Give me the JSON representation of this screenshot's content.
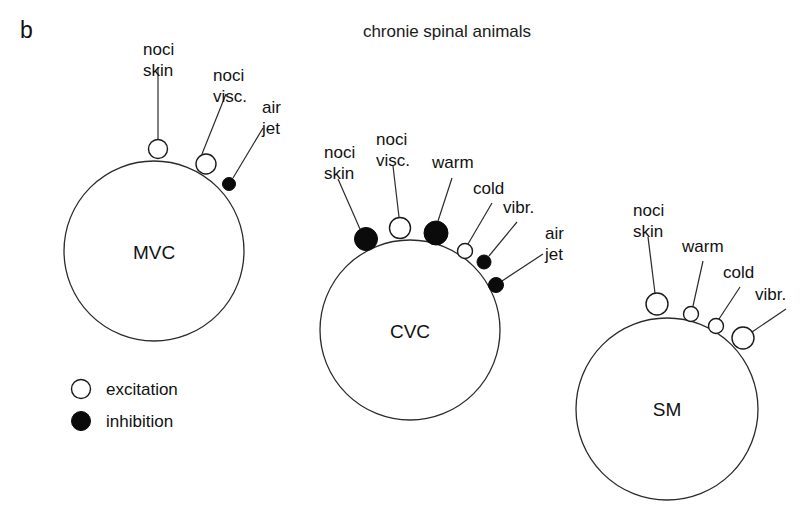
{
  "figure": {
    "panel_label": "b",
    "title": "chronie spinal animals",
    "colors": {
      "stroke": "#2b2b2b",
      "excitation_fill": "#ffffff",
      "inhibition_fill": "#0b0b0b",
      "background": "#ffffff"
    }
  },
  "legend": {
    "items": [
      {
        "symbol": "open-circle",
        "label": "excitation"
      },
      {
        "symbol": "filled-circle",
        "label": "inhibition"
      }
    ]
  },
  "groups": [
    {
      "id": "mvc",
      "name": "MVC",
      "circle": {
        "cx": 154,
        "cy": 251,
        "r": 90
      },
      "name_pos": {
        "x": 154,
        "y": 259
      },
      "markers": [
        {
          "id": "mvc-noci-skin",
          "label": "noci skin",
          "label_lines": [
            "noci",
            "skin"
          ],
          "type": "excitation",
          "marker": {
            "cx": 158,
            "cy": 149,
            "r": 9.5
          },
          "label_pos": {
            "x": 143,
            "y": 55
          },
          "connector": {
            "x1": 158,
            "y1": 139,
            "x2": 158,
            "y2": 67
          }
        },
        {
          "id": "mvc-noci-visc",
          "label": "noci visc.",
          "label_lines": [
            "noci",
            "visc."
          ],
          "type": "excitation",
          "marker": {
            "cx": 206,
            "cy": 164,
            "r": 10
          },
          "label_pos": {
            "x": 213,
            "y": 81
          },
          "connector": {
            "x1": 202,
            "y1": 154,
            "x2": 226,
            "y2": 94
          }
        },
        {
          "id": "mvc-air-jet",
          "label": "air jet",
          "label_lines": [
            "air",
            "jet"
          ],
          "type": "inhibition",
          "marker": {
            "cx": 229,
            "cy": 184,
            "r": 6.5
          },
          "label_pos": {
            "x": 262,
            "y": 113
          },
          "connector": {
            "x1": 233,
            "y1": 178,
            "x2": 263,
            "y2": 128
          }
        }
      ]
    },
    {
      "id": "cvc",
      "name": "CVC",
      "circle": {
        "cx": 410,
        "cy": 330,
        "r": 90
      },
      "name_pos": {
        "x": 410,
        "y": 338
      },
      "markers": [
        {
          "id": "cvc-noci-skin",
          "label": "noci skin",
          "label_lines": [
            "noci",
            "skin"
          ],
          "type": "inhibition",
          "marker": {
            "cx": 366,
            "cy": 239,
            "r": 11.5
          },
          "label_pos": {
            "x": 324,
            "y": 158
          },
          "connector": {
            "x1": 360,
            "y1": 229,
            "x2": 338,
            "y2": 179
          }
        },
        {
          "id": "cvc-noci-visc",
          "label": "noci visc.",
          "label_lines": [
            "noci",
            "visc."
          ],
          "type": "excitation",
          "marker": {
            "cx": 400,
            "cy": 228,
            "r": 10.5
          },
          "label_pos": {
            "x": 376,
            "y": 145
          },
          "connector": {
            "x1": 399,
            "y1": 217,
            "x2": 393,
            "y2": 166
          }
        },
        {
          "id": "cvc-warm",
          "label": "warm",
          "label_lines": [
            "warm"
          ],
          "type": "inhibition",
          "marker": {
            "cx": 436,
            "cy": 233,
            "r": 12
          },
          "label_pos": {
            "x": 432,
            "y": 168
          },
          "connector": {
            "x1": 438,
            "y1": 221,
            "x2": 452,
            "y2": 178
          }
        },
        {
          "id": "cvc-cold",
          "label": "cold",
          "label_lines": [
            "cold"
          ],
          "type": "excitation",
          "marker": {
            "cx": 465,
            "cy": 251,
            "r": 7.5
          },
          "label_pos": {
            "x": 473,
            "y": 194
          },
          "connector": {
            "x1": 468,
            "y1": 244,
            "x2": 492,
            "y2": 203
          }
        },
        {
          "id": "cvc-vibr",
          "label": "vibr.",
          "label_lines": [
            "vibr."
          ],
          "type": "inhibition",
          "marker": {
            "cx": 484,
            "cy": 262,
            "r": 7
          },
          "label_pos": {
            "x": 503,
            "y": 213
          },
          "connector": {
            "x1": 489,
            "y1": 256,
            "x2": 517,
            "y2": 222
          }
        },
        {
          "id": "cvc-air-jet",
          "label": "air jet",
          "label_lines": [
            "air",
            "jet"
          ],
          "type": "inhibition",
          "marker": {
            "cx": 496,
            "cy": 285,
            "r": 7.5
          },
          "label_pos": {
            "x": 545,
            "y": 239
          },
          "connector": {
            "x1": 502,
            "y1": 281,
            "x2": 543,
            "y2": 254
          }
        }
      ]
    },
    {
      "id": "sm",
      "name": "SM",
      "circle": {
        "cx": 667,
        "cy": 409,
        "r": 91
      },
      "name_pos": {
        "x": 667,
        "y": 416
      },
      "markers": [
        {
          "id": "sm-noci-skin",
          "label": "noci skin",
          "label_lines": [
            "noci",
            "skin"
          ],
          "type": "excitation",
          "marker": {
            "cx": 657,
            "cy": 304,
            "r": 11
          },
          "label_pos": {
            "x": 633,
            "y": 216
          },
          "connector": {
            "x1": 655,
            "y1": 293,
            "x2": 648,
            "y2": 237
          }
        },
        {
          "id": "sm-warm",
          "label": "warm",
          "label_lines": [
            "warm"
          ],
          "type": "excitation",
          "marker": {
            "cx": 691,
            "cy": 314,
            "r": 7.5
          },
          "label_pos": {
            "x": 682,
            "y": 252
          },
          "connector": {
            "x1": 693,
            "y1": 306,
            "x2": 703,
            "y2": 261
          }
        },
        {
          "id": "sm-cold",
          "label": "cold",
          "label_lines": [
            "cold"
          ],
          "type": "excitation",
          "marker": {
            "cx": 716,
            "cy": 326,
            "r": 7.5
          },
          "label_pos": {
            "x": 723,
            "y": 278
          },
          "connector": {
            "x1": 719,
            "y1": 319,
            "x2": 740,
            "y2": 287
          }
        },
        {
          "id": "sm-vibr",
          "label": "vibr.",
          "label_lines": [
            "vibr."
          ],
          "type": "excitation",
          "marker": {
            "cx": 743,
            "cy": 338,
            "r": 11
          },
          "label_pos": {
            "x": 755,
            "y": 300
          },
          "connector": {
            "x1": 752,
            "y1": 332,
            "x2": 786,
            "y2": 309
          }
        }
      ]
    }
  ]
}
